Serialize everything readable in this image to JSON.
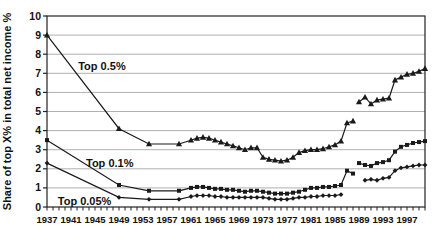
{
  "figure": {
    "background": "#ffffff"
  },
  "chart_data": {
    "type": "line",
    "title": "",
    "xlabel": "",
    "ylabel": "Share of top X% in total net income %",
    "xlim": [
      1937,
      2000
    ],
    "ylim": [
      0,
      10
    ],
    "grid": "horizontal",
    "legend_position": "none",
    "colors": {
      "line": "#1a1a1a",
      "grid": "#b0b0b0",
      "frame": "#222222",
      "text": "#111111"
    },
    "y_ticks": [
      0,
      1,
      2,
      3,
      4,
      5,
      6,
      7,
      8,
      9,
      10
    ],
    "x_tick_labels": [
      1937,
      1941,
      1945,
      1949,
      1953,
      1957,
      1961,
      1965,
      1969,
      1973,
      1977,
      1981,
      1985,
      1989,
      1993,
      1997
    ],
    "x_minor_tick_step": 1,
    "series": [
      {
        "name": "Top 0.5%",
        "marker": "triangle",
        "segments": [
          [
            [
              1937,
              9.0
            ],
            [
              1949,
              4.1
            ],
            [
              1954,
              3.3
            ],
            [
              1959,
              3.3
            ],
            [
              1961,
              3.5
            ],
            [
              1962,
              3.6
            ],
            [
              1963,
              3.65
            ],
            [
              1964,
              3.6
            ],
            [
              1965,
              3.5
            ],
            [
              1966,
              3.4
            ],
            [
              1967,
              3.3
            ],
            [
              1968,
              3.2
            ],
            [
              1969,
              3.1
            ],
            [
              1970,
              3.0
            ],
            [
              1971,
              3.1
            ],
            [
              1972,
              3.1
            ],
            [
              1973,
              2.6
            ],
            [
              1974,
              2.5
            ],
            [
              1975,
              2.45
            ],
            [
              1976,
              2.4
            ],
            [
              1977,
              2.45
            ],
            [
              1978,
              2.6
            ],
            [
              1979,
              2.85
            ],
            [
              1980,
              2.95
            ],
            [
              1981,
              3.0
            ],
            [
              1982,
              3.0
            ],
            [
              1983,
              3.05
            ],
            [
              1984,
              3.15
            ],
            [
              1985,
              3.25
            ],
            [
              1986,
              3.45
            ],
            [
              1987,
              4.4
            ],
            [
              1988,
              4.5
            ]
          ],
          [
            [
              1989,
              5.5
            ],
            [
              1990,
              5.75
            ],
            [
              1991,
              5.4
            ],
            [
              1992,
              5.6
            ],
            [
              1993,
              5.65
            ],
            [
              1994,
              5.7
            ],
            [
              1995,
              6.65
            ],
            [
              1996,
              6.8
            ],
            [
              1997,
              6.95
            ],
            [
              1998,
              7.0
            ],
            [
              1999,
              7.1
            ],
            [
              2000,
              7.25
            ]
          ]
        ]
      },
      {
        "name": "Top 0.1%",
        "marker": "square",
        "segments": [
          [
            [
              1937,
              3.5
            ],
            [
              1949,
              1.15
            ],
            [
              1954,
              0.85
            ],
            [
              1959,
              0.85
            ],
            [
              1961,
              1.0
            ],
            [
              1962,
              1.05
            ],
            [
              1963,
              1.05
            ],
            [
              1964,
              1.0
            ],
            [
              1965,
              0.95
            ],
            [
              1966,
              0.95
            ],
            [
              1967,
              0.9
            ],
            [
              1968,
              0.9
            ],
            [
              1969,
              0.85
            ],
            [
              1970,
              0.8
            ],
            [
              1971,
              0.85
            ],
            [
              1972,
              0.85
            ],
            [
              1973,
              0.8
            ],
            [
              1974,
              0.75
            ],
            [
              1975,
              0.7
            ],
            [
              1976,
              0.7
            ],
            [
              1977,
              0.7
            ],
            [
              1978,
              0.75
            ],
            [
              1979,
              0.8
            ],
            [
              1980,
              0.9
            ],
            [
              1981,
              1.0
            ],
            [
              1982,
              1.0
            ],
            [
              1983,
              1.05
            ],
            [
              1984,
              1.05
            ],
            [
              1985,
              1.1
            ],
            [
              1986,
              1.15
            ],
            [
              1987,
              1.9
            ],
            [
              1988,
              1.75
            ]
          ],
          [
            [
              1989,
              2.3
            ],
            [
              1990,
              2.2
            ],
            [
              1991,
              2.15
            ],
            [
              1992,
              2.3
            ],
            [
              1993,
              2.35
            ],
            [
              1994,
              2.45
            ],
            [
              1995,
              2.9
            ],
            [
              1996,
              3.15
            ],
            [
              1997,
              3.25
            ],
            [
              1998,
              3.35
            ],
            [
              1999,
              3.4
            ],
            [
              2000,
              3.45
            ]
          ]
        ]
      },
      {
        "name": "Top 0.05%",
        "marker": "diamond",
        "segments": [
          [
            [
              1937,
              2.3
            ],
            [
              1949,
              0.5
            ],
            [
              1954,
              0.4
            ],
            [
              1959,
              0.4
            ],
            [
              1961,
              0.55
            ],
            [
              1962,
              0.6
            ],
            [
              1963,
              0.6
            ],
            [
              1964,
              0.6
            ],
            [
              1965,
              0.55
            ],
            [
              1966,
              0.55
            ],
            [
              1967,
              0.5
            ],
            [
              1968,
              0.5
            ],
            [
              1969,
              0.5
            ],
            [
              1970,
              0.5
            ],
            [
              1971,
              0.5
            ],
            [
              1972,
              0.5
            ],
            [
              1973,
              0.5
            ],
            [
              1974,
              0.45
            ],
            [
              1975,
              0.4
            ],
            [
              1976,
              0.4
            ],
            [
              1977,
              0.4
            ],
            [
              1978,
              0.45
            ],
            [
              1979,
              0.5
            ],
            [
              1980,
              0.5
            ],
            [
              1981,
              0.55
            ],
            [
              1982,
              0.55
            ],
            [
              1983,
              0.6
            ],
            [
              1984,
              0.6
            ],
            [
              1985,
              0.6
            ],
            [
              1986,
              0.65
            ]
          ],
          [
            [
              1990,
              1.4
            ],
            [
              1991,
              1.45
            ],
            [
              1992,
              1.4
            ],
            [
              1993,
              1.5
            ],
            [
              1994,
              1.55
            ],
            [
              1995,
              1.9
            ],
            [
              1996,
              2.05
            ],
            [
              1997,
              2.1
            ],
            [
              1998,
              2.15
            ],
            [
              1999,
              2.2
            ],
            [
              2000,
              2.2
            ]
          ]
        ]
      }
    ],
    "annotations": [
      {
        "text": "Top 0.5%",
        "year": 1942.2,
        "value": 7.15,
        "anchor": "start"
      },
      {
        "text": "Top 0.1%",
        "year": 1943.5,
        "value": 2.08,
        "anchor": "start"
      },
      {
        "text": "Top 0.05%",
        "year": 1938.8,
        "value": 0.1,
        "anchor": "start"
      }
    ]
  }
}
